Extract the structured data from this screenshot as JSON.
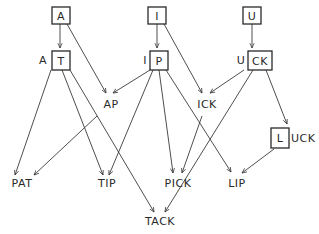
{
  "diagram": {
    "title": "",
    "nodes": [
      {
        "id": "A",
        "boxed": "A",
        "prefix": "",
        "suffix": ""
      },
      {
        "id": "I",
        "boxed": "I",
        "prefix": "",
        "suffix": ""
      },
      {
        "id": "U",
        "boxed": "U",
        "prefix": "",
        "suffix": ""
      },
      {
        "id": "AT",
        "boxed": "T",
        "prefix": "A",
        "suffix": ""
      },
      {
        "id": "IP",
        "boxed": "P",
        "prefix": "I",
        "suffix": ""
      },
      {
        "id": "UCK",
        "boxed": "CK",
        "prefix": "U",
        "suffix": ""
      },
      {
        "id": "AP",
        "label": "AP"
      },
      {
        "id": "ICK",
        "label": "ICK"
      },
      {
        "id": "LUCK",
        "boxed": "L",
        "prefix": "",
        "suffix": "UCK"
      },
      {
        "id": "PAT",
        "label": "PAT"
      },
      {
        "id": "TIP",
        "label": "TIP"
      },
      {
        "id": "PICK",
        "label": "PICK"
      },
      {
        "id": "LIP",
        "label": "LIP"
      },
      {
        "id": "TACK",
        "label": "TACK"
      }
    ],
    "edges": [
      [
        "A",
        "AT"
      ],
      [
        "A",
        "AP"
      ],
      [
        "I",
        "IP"
      ],
      [
        "I",
        "ICK"
      ],
      [
        "U",
        "UCK"
      ],
      [
        "AT",
        "PAT"
      ],
      [
        "AT",
        "TIP"
      ],
      [
        "AT",
        "TACK"
      ],
      [
        "AP",
        "PAT"
      ],
      [
        "IP",
        "AP"
      ],
      [
        "IP",
        "TIP"
      ],
      [
        "IP",
        "PICK"
      ],
      [
        "IP",
        "LIP"
      ],
      [
        "ICK",
        "PICK"
      ],
      [
        "UCK",
        "ICK"
      ],
      [
        "UCK",
        "TACK"
      ],
      [
        "UCK",
        "LUCK"
      ],
      [
        "LUCK",
        "LIP"
      ]
    ],
    "labels": {
      "A_box": "A",
      "I_box": "I",
      "U_box": "U",
      "AT_prefix": "A",
      "AT_box": "T",
      "IP_prefix": "I",
      "IP_box": "P",
      "UCK_prefix": "U",
      "UCK_box": "CK",
      "AP": "AP",
      "ICK": "ICK",
      "LUCK_box": "L",
      "LUCK_suffix": "UCK",
      "PAT": "PAT",
      "TIP": "TIP",
      "PICK": "PICK",
      "LIP": "LIP",
      "TACK": "TACK"
    },
    "colors": {
      "line": "#2a2a2a",
      "background": "#ffffff"
    }
  }
}
